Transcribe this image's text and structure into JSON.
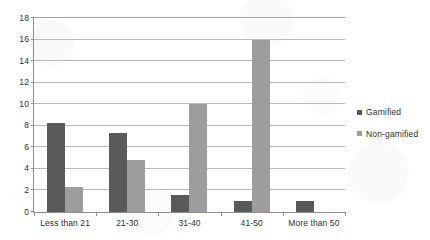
{
  "chart_data": {
    "type": "bar",
    "title": "",
    "subtitle": "",
    "xlabel": "",
    "ylabel": "",
    "categories": [
      "Less than 21",
      "21-30",
      "31-40",
      "41-50",
      "More than 50"
    ],
    "series": [
      {
        "name": "Gamified",
        "color": "#5a5a5a",
        "values": [
          8.3,
          7.3,
          1.6,
          1.0,
          1.0
        ]
      },
      {
        "name": "Non-gamified",
        "color": "#9d9d9d",
        "values": [
          2.3,
          4.8,
          10.0,
          16.0,
          0
        ]
      }
    ],
    "ylim": [
      0,
      18
    ],
    "ytick_step": 2,
    "yticks": [
      0,
      2,
      4,
      6,
      8,
      10,
      12,
      14,
      16,
      18
    ],
    "ytick_labels": [
      "0",
      "2",
      "4",
      "6",
      "8",
      "10",
      "12",
      "14",
      "16",
      "18"
    ],
    "grid": true,
    "grid_axis": "y",
    "legend_position": "right",
    "grouped": true,
    "bar_gap": 0
  },
  "legend": {
    "entries": [
      {
        "label": "Gamified",
        "marker": "square-swatch-dark"
      },
      {
        "label": "Non-gamified",
        "marker": "square-swatch-light"
      }
    ]
  },
  "colors": {
    "series_gamified": "#5a5a5a",
    "series_nongamified": "#9d9d9d",
    "gridline": "#b9b9b9",
    "axis": "#8d8d8d",
    "text": "#2e2e2e",
    "background": "#ffffff"
  }
}
